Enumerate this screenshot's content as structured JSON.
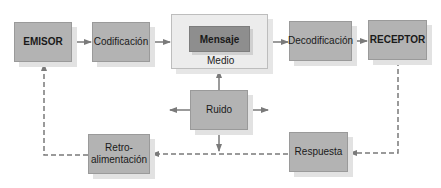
{
  "diagram": {
    "type": "communication-process-flow",
    "colors": {
      "box_fill": "#b3b3b3",
      "mensaje_fill": "#8e8e8e",
      "medio_fill": "#ececec",
      "arrow": "#7a7a7a",
      "shadow": "#e2e2e2"
    },
    "nodes": {
      "emisor": "EMISOR",
      "codificacion": "Codificación",
      "mensaje": "Mensaje",
      "medio": "Medio",
      "decodificacion": "Decodificación",
      "receptor": "RECEPTOR",
      "ruido": "Ruido",
      "retroalimentacion_line1": "Retro-",
      "retroalimentacion_line2": "alimentación",
      "respuesta": "Respuesta"
    },
    "edges": [
      {
        "from": "EMISOR",
        "to": "Codificación",
        "style": "solid"
      },
      {
        "from": "Codificación",
        "to": "Medio",
        "style": "solid"
      },
      {
        "from": "Medio",
        "to": "Decodificación",
        "style": "solid"
      },
      {
        "from": "Decodificación",
        "to": "RECEPTOR",
        "style": "solid"
      },
      {
        "from": "Ruido",
        "to": "Medio",
        "style": "solid"
      },
      {
        "from": "Ruido",
        "to": "left",
        "style": "solid"
      },
      {
        "from": "Ruido",
        "to": "right",
        "style": "solid"
      },
      {
        "from": "Ruido",
        "to": "down",
        "style": "solid"
      },
      {
        "from": "RECEPTOR",
        "to": "Respuesta",
        "style": "dashed"
      },
      {
        "from": "Respuesta",
        "to": "Retro-alimentación",
        "style": "dashed"
      },
      {
        "from": "Retro-alimentación",
        "to": "EMISOR",
        "style": "dashed"
      }
    ]
  }
}
